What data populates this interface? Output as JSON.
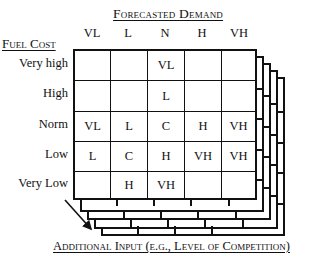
{
  "diagram": {
    "type": "3d-lookup-table",
    "column_axis": {
      "title": "Forecasted Demand",
      "labels": [
        "VL",
        "L",
        "N",
        "H",
        "VH"
      ]
    },
    "row_axis": {
      "title": "Fuel Cost",
      "labels": [
        "Very high",
        "High",
        "Norm",
        "Low",
        "Very Low"
      ]
    },
    "depth_axis": {
      "title": "Additional Input (e.g., Level of Competition)"
    },
    "cells": [
      [
        "",
        "",
        "VL",
        "",
        ""
      ],
      [
        "",
        "",
        "L",
        "",
        ""
      ],
      [
        "VL",
        "L",
        "C",
        "H",
        "VH"
      ],
      [
        "L",
        "C",
        "H",
        "VH",
        "VH"
      ],
      [
        "",
        "H",
        "VH",
        "",
        ""
      ]
    ],
    "stacked_layers": 4,
    "arrow": "depth-direction-arrow"
  }
}
